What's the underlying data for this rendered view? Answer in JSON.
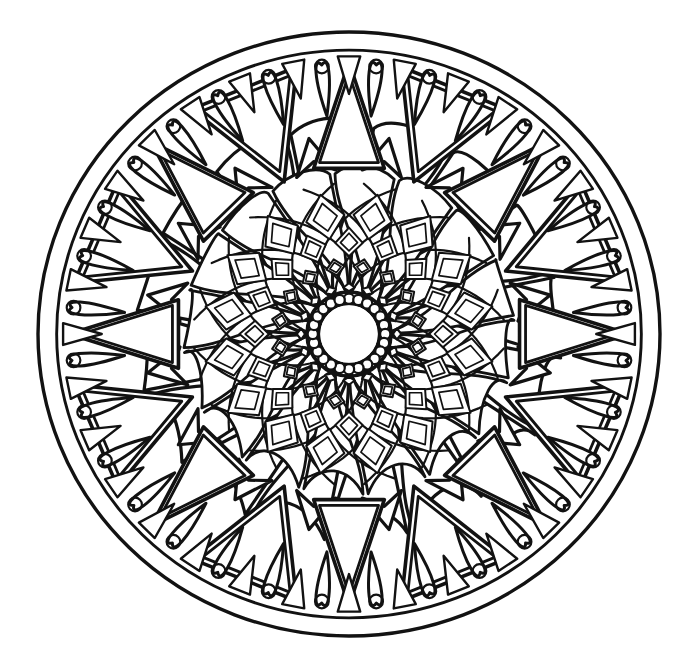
{
  "canvas": {
    "width": 699,
    "height": 666,
    "background_color": "#ffffff",
    "ink_color": "#121212"
  },
  "artwork": {
    "title": "Mandala Coloring Page",
    "style": "black line art on white",
    "type": "radial mandala / rose window",
    "center_x": 349,
    "center_y": 334,
    "radius_x": 311,
    "radius_y": 302,
    "symmetry": 16
  },
  "rings": [
    {
      "name": "outer-boundary-ring",
      "label": "Outer Boundary Circle",
      "radius_outer": 1.0,
      "radius_inner": 0.94,
      "stroke_width": 3.4,
      "element": "double-circle-rim"
    },
    {
      "name": "teardrop-bead-ring",
      "label": "Teardrop And Circle Border Ring",
      "radius_outer": 0.94,
      "radius_inner": 0.74,
      "count": 32,
      "stroke_width": 3.0,
      "element": "teardrop-with-inner-circle",
      "inner_circle_radius": 0.022,
      "separator": "small-triangle",
      "separator_count": 32
    },
    {
      "name": "large-triangle-ring",
      "label": "Large Triangle Ring",
      "radius_outer": 0.9,
      "radius_inner": 0.56,
      "count": 16,
      "stroke_width": 3.6,
      "element": "nested-triangle",
      "inset": 0.055
    },
    {
      "name": "chevron-arrow-ring",
      "label": "Chevron Arrow Ring",
      "radius_outer": 0.66,
      "radius_inner": 0.5,
      "count": 16,
      "stroke_width": 3.2,
      "element": "outward-arrow-head"
    },
    {
      "name": "outer-petal-ring",
      "label": "Outer Petal Ring",
      "radius_outer": 0.62,
      "radius_inner": 0.13,
      "count": 16,
      "stroke_width": 3.2,
      "element": "teardrop-petal",
      "spiral_twist_deg": 17,
      "bulb_radius": 0.155
    },
    {
      "name": "inner-petal-ring",
      "label": "Inner Petal Ring",
      "radius_outer": 0.48,
      "radius_inner": 0.11,
      "count": 16,
      "stroke_width": 2.8,
      "element": "teardrop-petal",
      "spiral_twist_deg": -17,
      "bulb_radius": 0.125
    },
    {
      "name": "spiral-lattice-ring",
      "label": "Spiral Lattice Ring",
      "radius_outer": 0.5,
      "radius_inner": 0.115,
      "count": 16,
      "stroke_width": 2.2,
      "element": "spiral-ray",
      "spiral_twist_deg": 62
    },
    {
      "name": "diamond-lattice-ring",
      "label": "Nested Diamond Lattice",
      "radius_bands": [
        0.155,
        0.225,
        0.305,
        0.395
      ],
      "count": 16,
      "stroke_width": 2.0,
      "element": "nested-diamond",
      "nesting_levels": 2
    },
    {
      "name": "center-bead-ring",
      "label": "Center Bead Ring",
      "radius_outer": 0.135,
      "radius_inner": 0.098,
      "count": 24,
      "bead_radius": 0.0165,
      "stroke_width": 3.6,
      "element": "bead-circle"
    },
    {
      "name": "center-disc",
      "label": "Center Open Disc",
      "radius_outer": 0.092,
      "stroke_width": 0.0,
      "element": "blank-disc"
    }
  ],
  "palette": {
    "ink": "#121212",
    "paper": "#ffffff"
  }
}
